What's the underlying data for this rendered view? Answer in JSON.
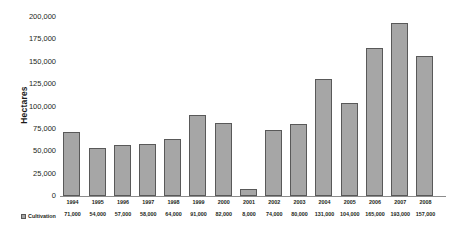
{
  "chart_data": {
    "type": "bar",
    "title": "",
    "subtitle": "",
    "xlabel": "",
    "ylabel": "Hectares",
    "ylim": [
      0,
      200000
    ],
    "grid": false,
    "legend_position": "bottom-left",
    "series_name": "Cultivation",
    "bar_color": "#a6a6a6",
    "bar_border_color": "#595959",
    "categories": [
      "1994",
      "1995",
      "1996",
      "1997",
      "1998",
      "1999",
      "2000",
      "2001",
      "2002",
      "2003",
      "2004",
      "2005",
      "2006",
      "2007",
      "2008"
    ],
    "values": [
      71000,
      54000,
      57000,
      58000,
      64000,
      91000,
      82000,
      8000,
      74000,
      80000,
      131000,
      104000,
      165000,
      193000,
      157000
    ],
    "value_labels": [
      "71,000",
      "54,000",
      "57,000",
      "58,000",
      "64,000",
      "91,000",
      "82,000",
      "8,000",
      "74,000",
      "80,000",
      "131,000",
      "104,000",
      "165,000",
      "193,000",
      "157,000"
    ],
    "yticks": [
      200000,
      175000,
      150000,
      125000,
      100000,
      75000,
      50000,
      25000,
      0
    ],
    "ytick_labels": [
      "200,000",
      "175,000",
      "150,000",
      "125,000",
      "100,000",
      "75,000",
      "50,000",
      "25,000",
      "0"
    ]
  },
  "legend": {
    "swatch_icon": "square-swatch-icon",
    "label": "Cultivation"
  }
}
